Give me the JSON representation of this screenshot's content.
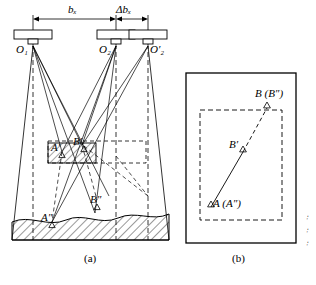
{
  "figure": {
    "panel_a": {
      "caption": "(a)",
      "dimension_labels": [
        {
          "id": "bx",
          "text": "bₓ"
        },
        {
          "id": "dbx",
          "text": "Δbₓ"
        }
      ],
      "point_labels": [
        {
          "id": "O1",
          "text": "O₁"
        },
        {
          "id": "O2",
          "text": "O₂"
        },
        {
          "id": "O2p",
          "text": "O′₂"
        },
        {
          "id": "Aprime",
          "text": "A′"
        },
        {
          "id": "Bprime",
          "text": "B′"
        },
        {
          "id": "Adprime",
          "text": "A″"
        },
        {
          "id": "Bdprime",
          "text": "B″"
        }
      ]
    },
    "panel_b": {
      "caption": "(b)",
      "point_labels": [
        {
          "id": "B",
          "text": "B (B″)"
        },
        {
          "id": "Bprime",
          "text": "B′"
        },
        {
          "id": "A",
          "text": "A (A″)"
        }
      ]
    },
    "margin_marks": {
      "text": "∶"
    }
  },
  "colors": {
    "stroke": "#000000",
    "background": "#ffffff",
    "hatch": "#000000"
  }
}
